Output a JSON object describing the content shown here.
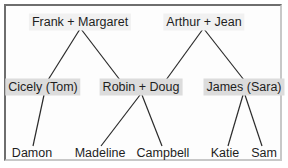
{
  "diagram": {
    "type": "family-tree",
    "colors": {
      "line": "#2a2a2a",
      "tier0_bg": "#f1f1f1",
      "tier1_bg": "#dcdcdc",
      "text": "#1e1e1e"
    },
    "nodes": {
      "frank_margaret": {
        "label": "Frank + Margaret",
        "x": 80,
        "y": 22,
        "tier": 0
      },
      "arthur_jean": {
        "label": "Arthur + Jean",
        "x": 204,
        "y": 22,
        "tier": 0
      },
      "cicely_tom": {
        "label": "Cicely (Tom)",
        "x": 43,
        "y": 87,
        "tier": 1
      },
      "robin_doug": {
        "label": "Robin + Doug",
        "x": 141,
        "y": 87,
        "tier": 1
      },
      "james_sara": {
        "label": "James (Sara)",
        "x": 244,
        "y": 87,
        "tier": 1
      },
      "damon": {
        "label": "Damon",
        "x": 32,
        "y": 153,
        "tier": 2
      },
      "madeline": {
        "label": "Madeline",
        "x": 100,
        "y": 153,
        "tier": 2
      },
      "campbell": {
        "label": "Campbell",
        "x": 163,
        "y": 153,
        "tier": 2
      },
      "katie": {
        "label": "Katie",
        "x": 225,
        "y": 153,
        "tier": 2
      },
      "sam": {
        "label": "Sam",
        "x": 264,
        "y": 153,
        "tier": 2
      }
    },
    "edges": [
      {
        "from": "frank_margaret",
        "to": "cicely_tom",
        "x1": 80,
        "y1": 29,
        "x2": 48,
        "y2": 80
      },
      {
        "from": "frank_margaret",
        "to": "robin_doug",
        "x1": 81,
        "y1": 29,
        "x2": 120,
        "y2": 80
      },
      {
        "from": "arthur_jean",
        "to": "robin_doug",
        "x1": 203,
        "y1": 29,
        "x2": 166,
        "y2": 80
      },
      {
        "from": "arthur_jean",
        "to": "james_sara",
        "x1": 204,
        "y1": 29,
        "x2": 244,
        "y2": 80
      },
      {
        "from": "cicely_tom",
        "to": "damon",
        "x1": 44,
        "y1": 95,
        "x2": 33,
        "y2": 146
      },
      {
        "from": "robin_doug",
        "to": "madeline",
        "x1": 140,
        "y1": 95,
        "x2": 101,
        "y2": 146
      },
      {
        "from": "robin_doug",
        "to": "campbell",
        "x1": 142,
        "y1": 95,
        "x2": 162,
        "y2": 146
      },
      {
        "from": "james_sara",
        "to": "katie",
        "x1": 243,
        "y1": 95,
        "x2": 228,
        "y2": 146
      },
      {
        "from": "james_sara",
        "to": "sam",
        "x1": 245,
        "y1": 95,
        "x2": 262,
        "y2": 146
      }
    ]
  }
}
